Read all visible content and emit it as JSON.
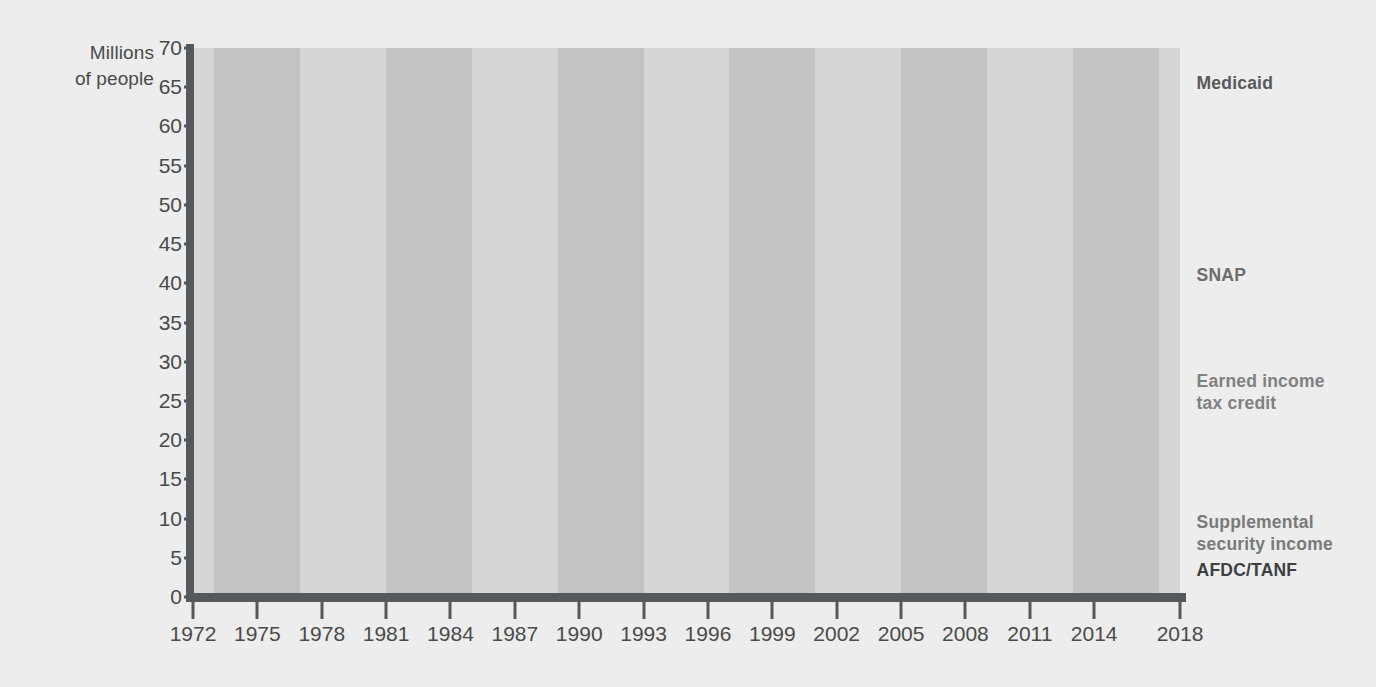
{
  "chart_data": {
    "type": "line",
    "title": "",
    "subtitle": "",
    "xlabel": "",
    "ylabel": "Millions\nof people",
    "xlim": [
      1972,
      2018
    ],
    "ylim": [
      0,
      70
    ],
    "ytick_step": 5,
    "grid": false,
    "legend_position": "right-inline",
    "background_bands": {
      "note": "alternating 4-year shaded vertical bands",
      "light_color": "#d5d6d6",
      "dark_color": "#c2c3c3",
      "edges": [
        1972,
        1973,
        1977,
        1981,
        1985,
        1989,
        1993,
        1997,
        2001,
        2005,
        2009,
        2013,
        2017,
        2018
      ]
    },
    "ytick_labels": [
      "0",
      "5",
      "10",
      "15",
      "20",
      "25",
      "30",
      "35",
      "40",
      "45",
      "50",
      "55",
      "60",
      "65",
      "70"
    ],
    "xtick_labels": [
      "1972",
      "1975",
      "1978",
      "1981",
      "1984",
      "1987",
      "1990",
      "1993",
      "1996",
      "1999",
      "2002",
      "2005",
      "2008",
      "2011",
      "2014",
      "2018"
    ],
    "xtick_values": [
      1972,
      1975,
      1978,
      1981,
      1984,
      1987,
      1990,
      1993,
      1996,
      1999,
      2002,
      2005,
      2008,
      2011,
      2014,
      2018
    ],
    "series": [
      {
        "name": "Medicaid",
        "color": "#57595b",
        "width": 5,
        "label_x": 2018.4,
        "label_y": 65.5,
        "x": [
          1972,
          1973,
          1974,
          1975,
          1976,
          1977,
          1978,
          1979,
          1980,
          1981,
          1982,
          1983,
          1984,
          1985,
          1986,
          1987,
          1988,
          1989,
          1990,
          1991,
          1992,
          1993,
          1994,
          1995,
          1996,
          1997,
          1998,
          1999,
          2000,
          2001,
          2002,
          2003,
          2004,
          2005,
          2006,
          2007,
          2008,
          2009,
          2010,
          2011,
          2012,
          2013,
          2014,
          2015,
          2016,
          2017,
          2018
        ],
        "values": [
          17.0,
          18.0,
          19.0,
          20.0,
          21.0,
          21.5,
          20.0,
          19.5,
          20.0,
          21.5,
          21.5,
          21.0,
          20.0,
          19.0,
          18.5,
          19.5,
          20.5,
          20.7,
          21.0,
          24.0,
          28.0,
          31.0,
          32.5,
          32.5,
          32.0,
          31.8,
          31.5,
          31.8,
          33.0,
          36.0,
          39.0,
          42.0,
          44.5,
          45.5,
          45.0,
          43.5,
          42.0,
          41.7,
          47.0,
          50.0,
          51.5,
          51.5,
          50.5,
          61.0,
          62.0,
          62.5,
          66.0
        ]
      },
      {
        "name": "SNAP",
        "color": "#6b6d6e",
        "width": 4,
        "label_x": 2018.4,
        "label_y": 41.0,
        "x": [
          1972,
          1973,
          1974,
          1975,
          1976,
          1977,
          1978,
          1979,
          1980,
          1981,
          1982,
          1983,
          1984,
          1985,
          1986,
          1987,
          1988,
          1989,
          1990,
          1991,
          1992,
          1993,
          1994,
          1995,
          1996,
          1997,
          1998,
          1999,
          2000,
          2001,
          2002,
          2003,
          2004,
          2005,
          2006,
          2007,
          2008,
          2009,
          2010,
          2011,
          2012,
          2013,
          2014,
          2015,
          2016,
          2017,
          2018
        ],
        "values": [
          11.0,
          11.5,
          12.0,
          13.5,
          15.0,
          16.5,
          16.5,
          17.0,
          19.0,
          20.5,
          21.0,
          21.0,
          20.5,
          19.5,
          19.5,
          19.0,
          18.7,
          18.8,
          20.0,
          22.5,
          25.0,
          26.5,
          26.5,
          25.5,
          24.5,
          21.5,
          19.0,
          17.5,
          16.5,
          16.0,
          17.0,
          19.0,
          21.0,
          22.5,
          23.0,
          23.5,
          25.5,
          29.0,
          36.0,
          41.0,
          45.0,
          46.5,
          47.0,
          45.0,
          43.5,
          42.0,
          40.5
        ]
      },
      {
        "name": "Earned income\ntax credit",
        "color": "#7f8182",
        "width": 4,
        "label_x": 2018.4,
        "label_y": 27.5,
        "x": [
          1975,
          1976,
          1977,
          1978,
          1979,
          1980,
          1981,
          1982,
          1983,
          1984,
          1985,
          1986,
          1987,
          1988,
          1989,
          1990,
          1991,
          1992,
          1993,
          1994,
          1995,
          1996,
          1997,
          1998,
          1999,
          2000,
          2001,
          2002,
          2003,
          2004,
          2005,
          2006,
          2007,
          2008,
          2009,
          2010,
          2011,
          2012,
          2013,
          2014,
          2015,
          2016,
          2017,
          2018
        ],
        "values": [
          0.0,
          4.0,
          4.5,
          4.5,
          4.0,
          4.0,
          4.5,
          4.5,
          4.5,
          4.5,
          4.0,
          4.0,
          4.0,
          4.0,
          4.5,
          5.0,
          5.5,
          5.5,
          5.5,
          5.7,
          5.8,
          6.0,
          6.5,
          7.0,
          8.0,
          9.5,
          11.0,
          13.0,
          15.0,
          17.0,
          18.5,
          20.0,
          20.5,
          21.0,
          22.0,
          23.5,
          25.0,
          26.0,
          27.0,
          28.5,
          28.0,
          27.5,
          27.0,
          26.8
        ]
      },
      {
        "name": "Supplemental\nsecurity income",
        "color": "#787a7b",
        "width": 4,
        "label_x": 2018.4,
        "label_y": 9.5,
        "x": [
          1973,
          1974,
          1975,
          1976,
          1977,
          1978,
          1979,
          1980,
          1981,
          1982,
          1983,
          1984,
          1985,
          1986,
          1987,
          1988,
          1989,
          1990,
          1991,
          1992,
          1993,
          1994,
          1995,
          1996,
          1997,
          1998,
          1999,
          2000,
          2001,
          2002,
          2003,
          2004,
          2005,
          2006,
          2007,
          2008,
          2009,
          2010,
          2011,
          2012,
          2013,
          2014,
          2015,
          2016,
          2017,
          2018
        ],
        "values": [
          0.0,
          3.2,
          3.9,
          4.3,
          4.3,
          4.2,
          4.1,
          4.1,
          4.0,
          3.9,
          3.9,
          4.0,
          4.1,
          4.3,
          4.4,
          4.5,
          4.6,
          4.8,
          5.1,
          5.6,
          5.9,
          6.1,
          6.2,
          6.3,
          6.2,
          6.5,
          6.5,
          6.6,
          6.7,
          6.8,
          6.9,
          7.0,
          7.1,
          7.2,
          7.3,
          7.4,
          7.6,
          7.9,
          8.0,
          8.0,
          8.0,
          8.0,
          8.0,
          8.0,
          7.9,
          7.8
        ]
      },
      {
        "name": "AFDC/TANF",
        "color": "#3d3f41",
        "width": 5,
        "label_x": 2018.4,
        "label_y": 3.4,
        "x": [
          1972,
          1973,
          1974,
          1975,
          1976,
          1977,
          1978,
          1979,
          1980,
          1981,
          1982,
          1983,
          1984,
          1985,
          1986,
          1987,
          1988,
          1989,
          1990,
          1991,
          1992,
          1993,
          1994,
          1995,
          1996,
          1997,
          1998,
          1999,
          2000,
          2001,
          2002,
          2003,
          2004,
          2005,
          2006,
          2007,
          2008,
          2009,
          2010,
          2011,
          2012,
          2013,
          2014,
          2015,
          2016,
          2017,
          2018
        ],
        "values": [
          11.0,
          11.0,
          11.0,
          11.3,
          11.3,
          11.0,
          10.5,
          10.3,
          10.5,
          11.0,
          10.5,
          10.7,
          10.8,
          10.8,
          10.8,
          10.9,
          10.9,
          10.9,
          11.4,
          12.5,
          13.5,
          14.0,
          14.0,
          13.5,
          12.5,
          10.5,
          8.5,
          7.2,
          6.0,
          5.5,
          5.2,
          5.0,
          4.8,
          4.6,
          4.4,
          4.2,
          3.8,
          4.0,
          4.4,
          4.4,
          4.2,
          4.0,
          3.8,
          3.7,
          3.5,
          3.2,
          3.3
        ]
      }
    ]
  },
  "axis": {
    "ylabel_line1": "Millions",
    "ylabel_line2": "of people"
  }
}
